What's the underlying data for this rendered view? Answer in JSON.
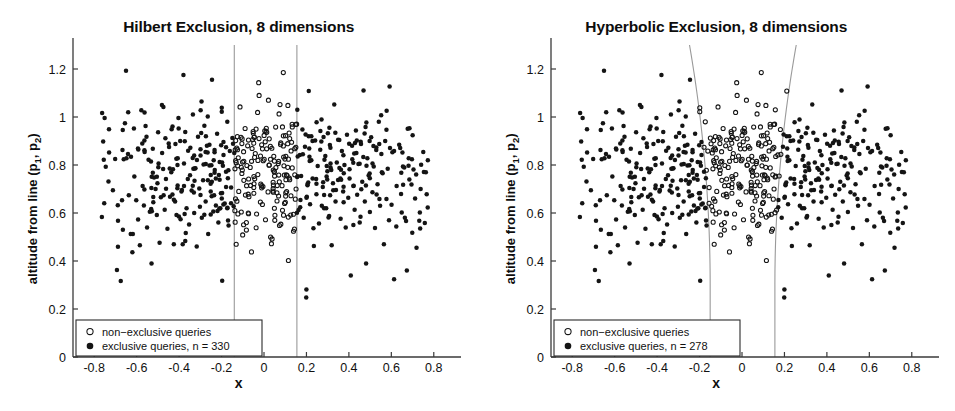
{
  "figure": {
    "background": "#ffffff",
    "marker_color": "#141414",
    "boundary_color": "#9a9a9a",
    "axis_color": "#3a3a3a"
  },
  "axes": {
    "xlabel": "x",
    "ylabel_prefix": "altitude from line (p",
    "ylabel_sub1": "1",
    "ylabel_mid": ", p",
    "ylabel_sub2": "2",
    "ylabel_suffix": ")",
    "ylabel_plain": "altitude from line (p1, p2)",
    "xticks": [
      "-0.8",
      "-0.6",
      "-0.4",
      "-0.2",
      "0",
      "0.2",
      "0.4",
      "0.6",
      "0.8"
    ],
    "xtick_values": [
      -0.8,
      -0.6,
      -0.4,
      -0.2,
      0,
      0.2,
      0.4,
      0.6,
      0.8
    ],
    "yticks": [
      "0",
      "0.2",
      "0.4",
      "0.6",
      "0.8",
      "1",
      "1.2"
    ],
    "ytick_values": [
      0,
      0.2,
      0.4,
      0.6,
      0.8,
      1.0,
      1.2
    ],
    "xlim": [
      -0.9,
      0.9
    ],
    "ylim": [
      0,
      1.3
    ],
    "grid": false,
    "spines": [
      "left",
      "bottom"
    ]
  },
  "legend": {
    "position": "lower-left",
    "marker_open": "open-circle",
    "marker_filled": "filled-circle",
    "label_non_exclusive": "non−exclusive queries"
  },
  "panels": [
    {
      "id": "hilbert",
      "title": "Hilbert Exclusion, 8 dimensions",
      "legend_exclusive": "exclusive queries, n = 330",
      "n_exclusive": 330,
      "boundary_type": "vertical-lines",
      "boundary_left_x": -0.14,
      "boundary_right_x": 0.155,
      "boundary_curvature": 0.0
    },
    {
      "id": "hyperbolic",
      "title": "Hyperbolic Exclusion, 8 dimensions",
      "legend_exclusive": "exclusive queries, n = 278",
      "n_exclusive": 278,
      "boundary_type": "hyperbolic-curves",
      "boundary_left_x": -0.15,
      "boundary_right_x": 0.155,
      "boundary_curvature": 0.55
    }
  ],
  "chart_data": {
    "type": "scatter",
    "xlabel": "x",
    "ylabel": "altitude from line (p1, p2)",
    "xlim": [
      -0.9,
      0.9
    ],
    "ylim": [
      0,
      1.3
    ],
    "grid": false,
    "legend_position": "lower-left",
    "panels": [
      {
        "name": "Hilbert Exclusion, 8 dimensions",
        "series": [
          {
            "name": "non-exclusive queries",
            "marker": "open-circle",
            "count": 270
          },
          {
            "name": "exclusive queries, n = 330",
            "marker": "filled-circle",
            "count": 330
          }
        ],
        "annotations": [
          {
            "type": "vline",
            "x": -0.14,
            "color": "#9a9a9a"
          },
          {
            "type": "vline",
            "x": 0.155,
            "color": "#9a9a9a"
          }
        ]
      },
      {
        "name": "Hyperbolic Exclusion, 8 dimensions",
        "series": [
          {
            "name": "non-exclusive queries",
            "marker": "open-circle",
            "count": 322
          },
          {
            "name": "exclusive queries, n = 278",
            "marker": "filled-circle",
            "count": 278
          }
        ],
        "annotations": [
          {
            "type": "hyperbola",
            "x_at_bottom": -0.15,
            "x_at_top": -0.3,
            "color": "#9a9a9a"
          },
          {
            "type": "hyperbola",
            "x_at_bottom": 0.155,
            "x_at_top": 0.305,
            "color": "#9a9a9a"
          }
        ]
      }
    ],
    "points": [
      [
        -0.755,
        0.822
      ],
      [
        -0.712,
        0.695
      ],
      [
        -0.693,
        0.362
      ],
      [
        -0.688,
        0.568
      ],
      [
        -0.675,
        0.317
      ],
      [
        -0.665,
        0.53
      ],
      [
        -0.661,
        0.824
      ],
      [
        -0.648,
        0.828
      ],
      [
        -0.64,
        1.02
      ],
      [
        -0.628,
        0.513
      ],
      [
        -0.618,
        0.512
      ],
      [
        -0.611,
        0.752
      ],
      [
        -0.602,
        0.653
      ],
      [
        -0.594,
        0.869
      ],
      [
        -0.585,
        0.466
      ],
      [
        -0.578,
        1.028
      ],
      [
        -0.572,
        0.713
      ],
      [
        -0.566,
        0.631
      ],
      [
        -0.558,
        0.962
      ],
      [
        -0.551,
        0.54
      ],
      [
        -0.544,
        0.822
      ],
      [
        -0.538,
        0.605
      ],
      [
        -0.53,
        0.39
      ],
      [
        -0.524,
        0.868
      ],
      [
        -0.518,
        0.748
      ],
      [
        -0.511,
        0.7
      ],
      [
        -0.505,
        0.592
      ],
      [
        -0.499,
        0.936
      ],
      [
        -0.492,
        0.476
      ],
      [
        -0.486,
        0.666
      ],
      [
        -0.48,
        0.85
      ],
      [
        -0.474,
        1.042
      ],
      [
        -0.468,
        0.614
      ],
      [
        -0.462,
        0.742
      ],
      [
        -0.455,
        0.534
      ],
      [
        -0.449,
        0.89
      ],
      [
        -0.443,
        0.668
      ],
      [
        -0.437,
        0.77
      ],
      [
        -0.431,
        0.96
      ],
      [
        -0.425,
        0.47
      ],
      [
        -0.419,
        0.648
      ],
      [
        -0.413,
        0.826
      ],
      [
        -0.407,
        0.715
      ],
      [
        -0.401,
        0.585
      ],
      [
        -0.395,
        0.9
      ],
      [
        -0.389,
        0.69
      ],
      [
        -0.383,
        0.47
      ],
      [
        -0.377,
        0.806
      ],
      [
        -0.371,
        0.938
      ],
      [
        -0.365,
        0.62
      ],
      [
        -0.359,
        0.742
      ],
      [
        -0.353,
        0.552
      ],
      [
        -0.347,
        0.872
      ],
      [
        -0.341,
        0.694
      ],
      [
        -0.335,
        1.01
      ],
      [
        -0.329,
        0.6
      ],
      [
        -0.323,
        0.786
      ],
      [
        -0.317,
        0.46
      ],
      [
        -0.311,
        0.918
      ],
      [
        -0.305,
        0.702
      ],
      [
        -0.299,
        0.84
      ],
      [
        -0.293,
        0.58
      ],
      [
        -0.287,
        0.736
      ],
      [
        -0.281,
        0.964
      ],
      [
        -0.275,
        0.648
      ],
      [
        -0.269,
        0.88
      ],
      [
        -0.263,
        0.512
      ],
      [
        -0.257,
        0.798
      ],
      [
        -0.251,
        0.69
      ],
      [
        -0.245,
        1.155
      ],
      [
        -0.239,
        0.606
      ],
      [
        -0.233,
        0.862
      ],
      [
        -0.227,
        0.744
      ],
      [
        -0.221,
        0.93
      ],
      [
        -0.215,
        0.56
      ],
      [
        -0.209,
        0.812
      ],
      [
        -0.203,
        0.682
      ],
      [
        -0.197,
        0.318
      ],
      [
        -0.191,
        0.896
      ],
      [
        -0.185,
        0.64
      ],
      [
        -0.179,
        0.772
      ],
      [
        -0.173,
        0.98
      ],
      [
        -0.167,
        0.548
      ],
      [
        -0.161,
        0.858
      ],
      [
        -0.155,
        0.706
      ],
      [
        -0.149,
        0.912
      ],
      [
        -0.143,
        0.628
      ],
      [
        -0.137,
        0.784
      ],
      [
        -0.131,
        0.47
      ],
      [
        -0.125,
        0.864
      ],
      [
        -0.119,
        0.69
      ],
      [
        -0.113,
        1.042
      ],
      [
        -0.107,
        0.604
      ],
      [
        -0.101,
        0.812
      ],
      [
        -0.095,
        0.736
      ],
      [
        -0.089,
        0.952
      ],
      [
        -0.083,
        0.56
      ],
      [
        -0.077,
        0.88
      ],
      [
        -0.071,
        0.668
      ],
      [
        -0.065,
        0.79
      ],
      [
        -0.059,
        0.438
      ],
      [
        -0.053,
        0.906
      ],
      [
        -0.047,
        0.722
      ],
      [
        -0.041,
        0.848
      ],
      [
        -0.035,
        0.596
      ],
      [
        -0.029,
        0.76
      ],
      [
        -0.023,
        1.09
      ],
      [
        -0.017,
        0.646
      ],
      [
        -0.011,
        0.884
      ],
      [
        -0.005,
        0.71
      ],
      [
        0.001,
        0.824
      ],
      [
        0.007,
        0.572
      ],
      [
        0.013,
        0.936
      ],
      [
        0.019,
        0.688
      ],
      [
        0.025,
        0.8
      ],
      [
        0.031,
        0.5
      ],
      [
        0.037,
        0.87
      ],
      [
        0.043,
        0.728
      ],
      [
        0.049,
        0.62
      ],
      [
        0.055,
        0.958
      ],
      [
        0.061,
        0.684
      ],
      [
        0.067,
        0.806
      ],
      [
        0.073,
        0.548
      ],
      [
        0.079,
        0.892
      ],
      [
        0.085,
        0.714
      ],
      [
        0.091,
        1.185
      ],
      [
        0.097,
        0.64
      ],
      [
        0.103,
        0.836
      ],
      [
        0.109,
        0.756
      ],
      [
        0.115,
        0.402
      ],
      [
        0.121,
        0.91
      ],
      [
        0.127,
        0.672
      ],
      [
        0.133,
        0.788
      ],
      [
        0.139,
        0.524
      ],
      [
        0.145,
        0.868
      ],
      [
        0.151,
        0.7
      ],
      [
        0.157,
        1.03
      ],
      [
        0.163,
        0.612
      ],
      [
        0.169,
        0.842
      ],
      [
        0.175,
        0.754
      ],
      [
        0.181,
        0.948
      ],
      [
        0.187,
        0.58
      ],
      [
        0.193,
        0.876
      ],
      [
        0.199,
        0.248
      ],
      [
        0.205,
        0.716
      ],
      [
        0.211,
        1.108
      ],
      [
        0.217,
        0.636
      ],
      [
        0.223,
        0.82
      ],
      [
        0.229,
        0.744
      ],
      [
        0.235,
        0.462
      ],
      [
        0.241,
        0.902
      ],
      [
        0.247,
        0.678
      ],
      [
        0.253,
        0.796
      ],
      [
        0.259,
        0.556
      ],
      [
        0.265,
        0.864
      ],
      [
        0.271,
        0.99
      ],
      [
        0.277,
        0.708
      ],
      [
        0.283,
        0.62
      ],
      [
        0.289,
        0.838
      ],
      [
        0.295,
        0.752
      ],
      [
        0.301,
        0.932
      ],
      [
        0.307,
        0.588
      ],
      [
        0.313,
        0.872
      ],
      [
        0.319,
        0.466
      ],
      [
        0.325,
        0.724
      ],
      [
        0.331,
        1.052
      ],
      [
        0.337,
        0.648
      ],
      [
        0.343,
        0.81
      ],
      [
        0.349,
        0.738
      ],
      [
        0.355,
        0.904
      ],
      [
        0.361,
        0.576
      ],
      [
        0.367,
        0.858
      ],
      [
        0.373,
        0.69
      ],
      [
        0.379,
        0.8
      ],
      [
        0.385,
        0.54
      ],
      [
        0.391,
        0.926
      ],
      [
        0.397,
        0.664
      ],
      [
        0.403,
        0.782
      ],
      [
        0.409,
        0.34
      ],
      [
        0.415,
        0.88
      ],
      [
        0.421,
        0.712
      ],
      [
        0.427,
        0.614
      ],
      [
        0.433,
        0.944
      ],
      [
        0.439,
        0.676
      ],
      [
        0.445,
        0.804
      ],
      [
        0.451,
        0.56
      ],
      [
        0.457,
        0.888
      ],
      [
        0.463,
        0.73
      ],
      [
        0.469,
        1.11
      ],
      [
        0.475,
        0.648
      ],
      [
        0.481,
        0.39
      ],
      [
        0.487,
        0.828
      ],
      [
        0.493,
        0.756
      ],
      [
        0.499,
        0.604
      ],
      [
        0.505,
        0.916
      ],
      [
        0.511,
        0.686
      ],
      [
        0.517,
        0.794
      ],
      [
        0.523,
        0.538
      ],
      [
        0.529,
        0.862
      ],
      [
        0.535,
        0.72
      ],
      [
        0.541,
        0.98
      ],
      [
        0.547,
        0.63
      ],
      [
        0.553,
        0.846
      ],
      [
        0.559,
        0.766
      ],
      [
        0.565,
        0.47
      ],
      [
        0.571,
        0.9
      ],
      [
        0.577,
        0.658
      ],
      [
        0.583,
        0.784
      ],
      [
        0.589,
        0.57
      ],
      [
        0.601,
        0.634
      ],
      [
        0.613,
        0.324
      ],
      [
        0.625,
        0.712
      ],
      [
        0.637,
        0.884
      ],
      [
        0.649,
        0.602
      ],
      [
        0.661,
        0.79
      ],
      [
        0.673,
        0.36
      ],
      [
        0.685,
        0.74
      ],
      [
        0.697,
        0.824
      ],
      [
        0.712,
        0.66
      ],
      [
        0.738,
        0.7
      ],
      [
        0.772,
        0.82
      ]
    ]
  }
}
